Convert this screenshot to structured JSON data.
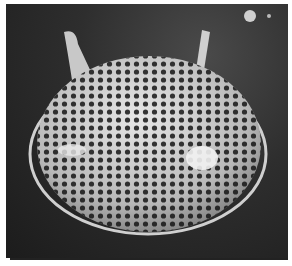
{
  "image": {
    "subject": "perforated dome-shaped microscopic shell with two horn-like spines",
    "style": "grayscale scanning electron micrograph",
    "colors": {
      "background": "#2a2a2a",
      "shell": "#d8d8d8",
      "pores": "#141414",
      "border": "#ffffff"
    }
  }
}
